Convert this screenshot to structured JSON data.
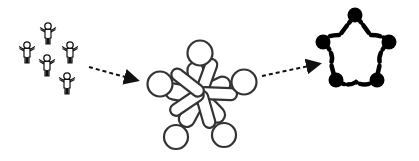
{
  "diagram": {
    "type": "process-flow",
    "stages": [
      {
        "id": "individuals",
        "label": "",
        "description": "group of five individual people figures",
        "count": 5
      },
      {
        "id": "intertwined",
        "label": "",
        "description": "five circles with overlapping elongated links forming a tangled star"
      },
      {
        "id": "ring",
        "label": "",
        "description": "five filled nodes connected by dashed arcs in a star-shaped ring",
        "count": 5
      }
    ],
    "arrows": [
      {
        "from": "individuals",
        "to": "intertwined",
        "style": "dashed"
      },
      {
        "from": "intertwined",
        "to": "ring",
        "style": "dashed"
      }
    ],
    "colors": {
      "stroke": "#333333",
      "fill_dark": "#000000",
      "background": "#ffffff"
    }
  }
}
